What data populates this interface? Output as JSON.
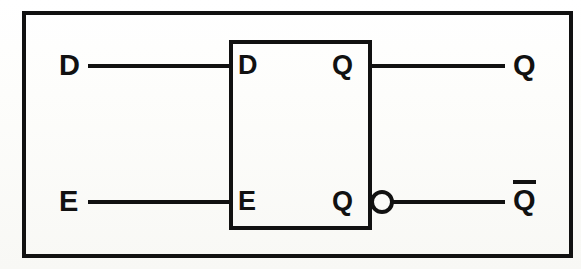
{
  "colors": {
    "ink": "#111111",
    "paper": "#fbfbf9"
  },
  "inputs": [
    {
      "id": "d-input",
      "label": "D",
      "pin_label": "D",
      "y": 66
    },
    {
      "id": "e-input",
      "label": "E",
      "pin_label": "E",
      "y": 202
    }
  ],
  "outputs": [
    {
      "id": "q-output",
      "label": "Q",
      "pin_label": "Q",
      "inverted": false,
      "overline": false,
      "y": 66
    },
    {
      "id": "qbar-output",
      "label": "Q",
      "pin_label": "Q",
      "inverted": true,
      "overline": true,
      "y": 202
    }
  ],
  "labels": {
    "external_d": "D",
    "external_e": "E",
    "external_q": "Q",
    "external_qbar": "Q",
    "internal_d": "D",
    "internal_e": "E",
    "internal_q_top": "Q",
    "internal_q_bottom": "Q"
  },
  "symbols": {
    "inversion_bubble": "inversion-bubble",
    "overline": "complement-overbar"
  }
}
